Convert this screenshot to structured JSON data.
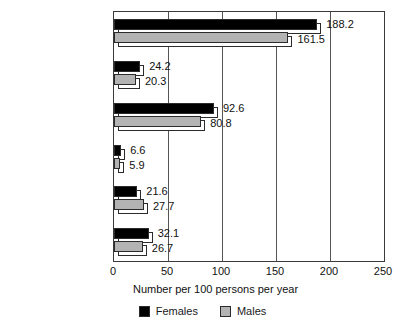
{
  "chart_data": {
    "type": "bar",
    "orientation": "horizontal",
    "title": "",
    "xlabel": "Number per 100 persons per year",
    "ylabel": "",
    "xlim": [
      0,
      250
    ],
    "xticks": [
      0,
      50,
      100,
      150,
      200,
      250
    ],
    "grid": true,
    "grid_axis": "x",
    "legend_position": "bottom",
    "categories": [
      "All acute conditions",
      "Infectious & parasitic",
      "Respiratory",
      "Digestive",
      "Injuries",
      "All other"
    ],
    "series": [
      {
        "name": "Females",
        "color": "#000000",
        "values": [
          188.2,
          24.2,
          92.6,
          6.6,
          21.6,
          32.1
        ],
        "labels": [
          "188.2",
          "24.2",
          "92.6",
          "6.6",
          "21.6",
          "32.1"
        ]
      },
      {
        "name": "Males",
        "color": "#b3b3b3",
        "values": [
          161.5,
          20.3,
          80.8,
          5.9,
          27.7,
          26.7
        ],
        "labels": [
          "161.5",
          "20.3",
          "80.8",
          "5.9",
          "27.7",
          "26.7"
        ]
      }
    ]
  },
  "legend": {
    "items": [
      {
        "label": "Females",
        "swatch": "legend-swatch-females"
      },
      {
        "label": "Males",
        "swatch": "legend-swatch-males"
      }
    ]
  },
  "axis": {
    "x_title": "Number per 100 persons per year",
    "tick_labels": [
      "0",
      "50",
      "100",
      "150",
      "200",
      "250"
    ]
  }
}
